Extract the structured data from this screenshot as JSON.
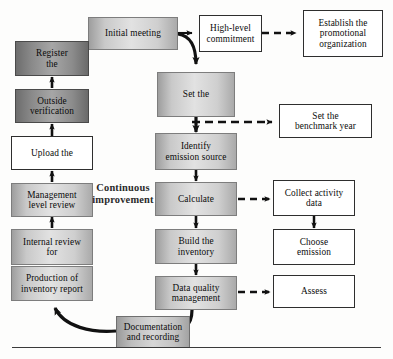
{
  "diagram": {
    "cycle_label": "Continuous\nimprovement",
    "colors": {
      "box_light": "#d8d8d8",
      "box_mid": "#c6c6c6",
      "box_dark": "#8f8f8f",
      "box_plain": "#ffffff",
      "line": "#111111",
      "border": "#3b3b3b"
    },
    "nodes": {
      "initial_meeting": "Initial meeting",
      "high_level_commitment": "High-level\ncommitment",
      "establish_promotional_organization": "Establish the\npromotional\norganization",
      "set_the": "Set the",
      "set_benchmark_year": "Set the\nbenchmark year",
      "identify_emission_source": "Identify\nemission source",
      "calculate": "Calculate",
      "collect_activity_data": "Collect activity\ndata",
      "build_the_inventory": "Build the\ninventory",
      "choose_emission": "Choose\nemission",
      "data_quality_management": "Data quality\nmanagement",
      "assess": "Assess",
      "documentation_and_recording": "Documentation\nand recording",
      "production_of_inventory_report": "Production of\ninventory report",
      "internal_review_for": "Internal review\nfor",
      "management_level_review": "Management\nlevel review",
      "upload_the": "Upload the",
      "outside_verification": "Outside\nverification",
      "register_the": "Register\nthe"
    },
    "edges": [
      {
        "name": "initial-meeting-to-high-level-commitment",
        "style": "solid-straight"
      },
      {
        "name": "high-level-commitment-to-establish-promotional-organization",
        "style": "dashed-straight"
      },
      {
        "name": "initial-meeting-to-set-the",
        "style": "solid-curved"
      },
      {
        "name": "set-the-to-identify-emission-source",
        "style": "solid-straight"
      },
      {
        "name": "set-the-to-set-benchmark-year",
        "style": "dashed-straight"
      },
      {
        "name": "identify-emission-source-to-calculate",
        "style": "solid-straight"
      },
      {
        "name": "calculate-to-collect-activity-data",
        "style": "dashed-straight"
      },
      {
        "name": "collect-activity-data-to-choose-emission",
        "style": "solid-straight"
      },
      {
        "name": "calculate-to-build-the-inventory",
        "style": "solid-straight"
      },
      {
        "name": "build-the-inventory-to-data-quality-management",
        "style": "solid-straight"
      },
      {
        "name": "data-quality-management-to-assess",
        "style": "dashed-straight"
      },
      {
        "name": "data-quality-management-to-documentation-and-recording",
        "style": "solid-curved"
      },
      {
        "name": "documentation-and-recording-to-production-of-inventory-report",
        "style": "solid-curved"
      },
      {
        "name": "production-of-inventory-report-to-internal-review-for",
        "style": "solid-straight"
      },
      {
        "name": "internal-review-for-to-management-level-review",
        "style": "solid-straight"
      },
      {
        "name": "management-level-review-to-upload-the",
        "style": "solid-straight"
      },
      {
        "name": "upload-the-to-outside-verification",
        "style": "solid-straight"
      },
      {
        "name": "outside-verification-to-register-the",
        "style": "solid-straight"
      }
    ]
  }
}
